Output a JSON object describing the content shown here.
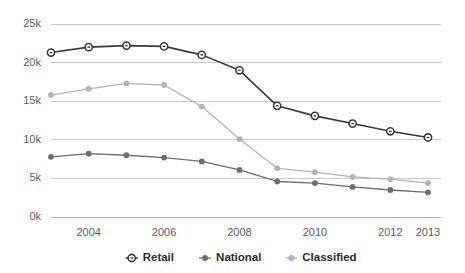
{
  "chart_data": {
    "type": "line",
    "title": "",
    "subtitle": "",
    "xlabel": "",
    "ylabel": "",
    "x": [
      2003,
      2004,
      2005,
      2006,
      2007,
      2008,
      2009,
      2010,
      2011,
      2012,
      2013
    ],
    "categories": [
      "2003",
      "2004",
      "2005",
      "2006",
      "2007",
      "2008",
      "2009",
      "2010",
      "2011",
      "2012",
      "2013"
    ],
    "x_tick_labels": [
      "2004",
      "2006",
      "2008",
      "2010",
      "2012",
      "2013"
    ],
    "x_tick_values": [
      2004,
      2006,
      2008,
      2010,
      2012,
      2013
    ],
    "y_tick_labels": [
      "0k",
      "5k",
      "10k",
      "15k",
      "20k",
      "25k"
    ],
    "y_tick_values": [
      0,
      5000,
      10000,
      15000,
      20000,
      25000
    ],
    "ylim": [
      0,
      25000
    ],
    "xlim": [
      2003,
      2013
    ],
    "grid": true,
    "legend_position": "bottom",
    "series": [
      {
        "name": "Retail",
        "color": "#3a3a3a",
        "marker": "open-circle",
        "values": [
          21300,
          22000,
          22200,
          22100,
          21000,
          19000,
          14400,
          13100,
          12100,
          11100,
          10300
        ]
      },
      {
        "name": "National",
        "color": "#6e6e6e",
        "marker": "filled-circle",
        "values": [
          7800,
          8200,
          8000,
          7700,
          7200,
          6100,
          4600,
          4400,
          3900,
          3500,
          3200
        ]
      },
      {
        "name": "Classified",
        "color": "#b3b3b3",
        "marker": "filled-circle",
        "values": [
          15800,
          16600,
          17300,
          17100,
          14300,
          10100,
          6300,
          5800,
          5200,
          4900,
          4400
        ]
      }
    ]
  },
  "legend": {
    "items": [
      {
        "label": "Retail",
        "color": "#3a3a3a",
        "marker": "open-circle"
      },
      {
        "label": "National",
        "color": "#6e6e6e",
        "marker": "filled-circle"
      },
      {
        "label": "Classified",
        "color": "#b3b3b3",
        "marker": "filled-circle"
      }
    ]
  },
  "colors": {
    "background": "#ffffff",
    "gridline": "#c9c9c9",
    "axis": "#b8b8b8",
    "tick_text": "#5b5b5b",
    "legend_text": "#2b2b2b"
  }
}
